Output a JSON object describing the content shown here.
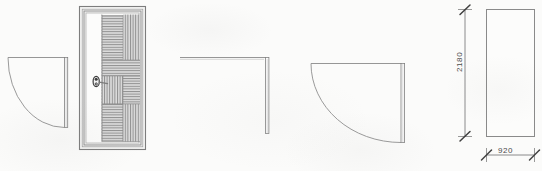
{
  "drawing": {
    "title": "Door plan and elevation drawing",
    "background_color": "#fbfbfa",
    "line_color": "#8a8a8a",
    "text_color": "#4a4a4a",
    "hatch_color": "#9a9a9a",
    "panel_fill": "#d8d8d8"
  },
  "views": {
    "plan_left": {
      "name": "Door swing plan left",
      "leaf_label": "",
      "swing": "quarter-arc"
    },
    "elevation": {
      "name": "Door elevation",
      "frame_label": "",
      "handle_label": "",
      "panels": [
        "upper-panel",
        "middle-panel",
        "lower-panel"
      ]
    },
    "plan_middle": {
      "name": "Door jamb corner plan",
      "leaf_label": ""
    },
    "plan_right": {
      "name": "Door swing plan right",
      "leaf_label": "",
      "swing": "quarter-arc"
    },
    "dimensioned_rect": {
      "name": "Dimensioned door leaf outline"
    }
  },
  "dimensions": {
    "height": "2180",
    "width": "920",
    "height_units": "",
    "width_units": ""
  }
}
